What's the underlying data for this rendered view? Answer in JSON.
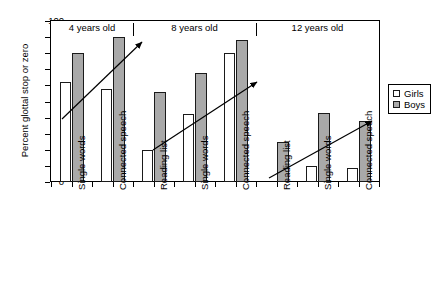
{
  "chart_data": {
    "type": "bar",
    "title": "",
    "xlabel": "",
    "ylabel": "Percent glottal stop or zero",
    "ylim": [
      0,
      100
    ],
    "y_ticks": [
      0,
      10,
      20,
      30,
      40,
      50,
      60,
      70,
      80,
      90,
      100
    ],
    "grid": false,
    "legend_position": "right",
    "categories": [
      "Single words",
      "Connected speech",
      "Reading list",
      "Single words",
      "Connected speech",
      "Reading list",
      "Single words",
      "Connected speech"
    ],
    "groups": [
      {
        "label": "4 years old",
        "categories": [
          "Single words",
          "Connected speech"
        ]
      },
      {
        "label": "8 years old",
        "categories": [
          "Reading list",
          "Single words",
          "Connected speech"
        ]
      },
      {
        "label": "12 years old",
        "categories": [
          "Reading list",
          "Single words",
          "Connected speech"
        ]
      }
    ],
    "series": [
      {
        "name": "Girls",
        "color": "#ffffff",
        "values": [
          62,
          58,
          20,
          42,
          80,
          0,
          10,
          9
        ]
      },
      {
        "name": "Boys",
        "color": "#a9a9a9",
        "values": [
          80,
          90,
          56,
          68,
          88,
          25,
          43,
          38
        ]
      }
    ],
    "annotations": [
      {
        "name": "trend-arrow-4-years",
        "description": "rising trend arrow over 4 years old group"
      },
      {
        "name": "trend-arrow-8-years",
        "description": "rising trend arrow over 8 years old group"
      },
      {
        "name": "trend-arrow-12-years",
        "description": "rising trend arrow over 12 years old group"
      }
    ]
  },
  "legend": {
    "items": [
      {
        "label": "Girls"
      },
      {
        "label": "Boys"
      }
    ]
  }
}
